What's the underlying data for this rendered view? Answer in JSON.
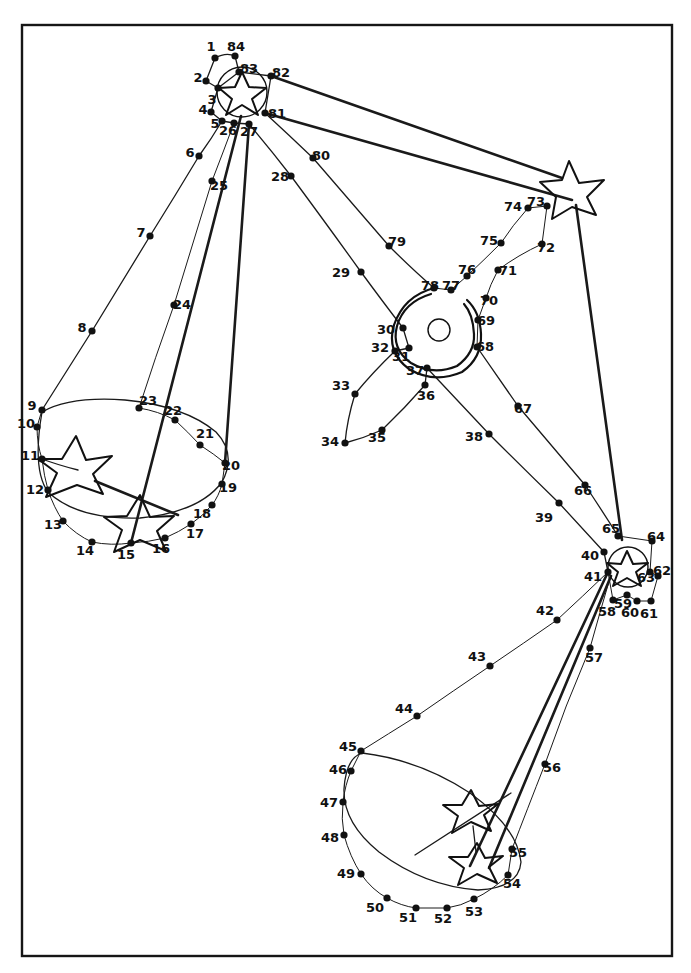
{
  "page": {
    "width": 691,
    "height": 973,
    "background_color": "#ffffff",
    "ink_color": "#111111",
    "frame": {
      "x": 22,
      "y": 25,
      "width": 650,
      "height": 931,
      "stroke": "#161616"
    }
  },
  "puzzle": {
    "kind": "connect-the-dots",
    "dot_count": 84,
    "star_count": 4,
    "description": "Hand drawn dot-to-dot line art with four five-pointed stars, two large ellipses, and a central spiral ring",
    "dots": [
      {
        "n": "1",
        "x": 215,
        "y": 58,
        "lx": 211,
        "ly": 47
      },
      {
        "n": "2",
        "x": 206,
        "y": 81,
        "lx": 198,
        "ly": 78
      },
      {
        "n": "3",
        "x": 218,
        "y": 88,
        "lx": 212,
        "ly": 100
      },
      {
        "n": "4",
        "x": 211,
        "y": 112,
        "lx": 203,
        "ly": 110
      },
      {
        "n": "5",
        "x": 222,
        "y": 121,
        "lx": 215,
        "ly": 124
      },
      {
        "n": "6",
        "x": 199,
        "y": 156,
        "lx": 190,
        "ly": 153
      },
      {
        "n": "7",
        "x": 150,
        "y": 236,
        "lx": 141,
        "ly": 233
      },
      {
        "n": "8",
        "x": 92,
        "y": 331,
        "lx": 82,
        "ly": 328
      },
      {
        "n": "9",
        "x": 42,
        "y": 410,
        "lx": 32,
        "ly": 406
      },
      {
        "n": "10",
        "x": 37,
        "y": 427,
        "lx": 26,
        "ly": 424
      },
      {
        "n": "11",
        "x": 42,
        "y": 459,
        "lx": 30,
        "ly": 456
      },
      {
        "n": "12",
        "x": 48,
        "y": 490,
        "lx": 35,
        "ly": 490
      },
      {
        "n": "13",
        "x": 63,
        "y": 521,
        "lx": 53,
        "ly": 525
      },
      {
        "n": "14",
        "x": 92,
        "y": 542,
        "lx": 85,
        "ly": 551
      },
      {
        "n": "15",
        "x": 131,
        "y": 543,
        "lx": 126,
        "ly": 555
      },
      {
        "n": "16",
        "x": 165,
        "y": 538,
        "lx": 161,
        "ly": 549
      },
      {
        "n": "17",
        "x": 191,
        "y": 524,
        "lx": 195,
        "ly": 534
      },
      {
        "n": "18",
        "x": 212,
        "y": 505,
        "lx": 202,
        "ly": 514
      },
      {
        "n": "19",
        "x": 222,
        "y": 484,
        "lx": 228,
        "ly": 488
      },
      {
        "n": "20",
        "x": 225,
        "y": 463,
        "lx": 231,
        "ly": 466
      },
      {
        "n": "21",
        "x": 200,
        "y": 445,
        "lx": 205,
        "ly": 434
      },
      {
        "n": "22",
        "x": 175,
        "y": 420,
        "lx": 173,
        "ly": 411
      },
      {
        "n": "23",
        "x": 139,
        "y": 408,
        "lx": 148,
        "ly": 401
      },
      {
        "n": "24",
        "x": 174,
        "y": 305,
        "lx": 182,
        "ly": 305
      },
      {
        "n": "25",
        "x": 212,
        "y": 181,
        "lx": 219,
        "ly": 186
      },
      {
        "n": "26",
        "x": 234,
        "y": 123,
        "lx": 228,
        "ly": 131
      },
      {
        "n": "27",
        "x": 249,
        "y": 124,
        "lx": 249,
        "ly": 132
      },
      {
        "n": "28",
        "x": 291,
        "y": 176,
        "lx": 280,
        "ly": 177
      },
      {
        "n": "29",
        "x": 361,
        "y": 272,
        "lx": 341,
        "ly": 273
      },
      {
        "n": "30",
        "x": 403,
        "y": 328,
        "lx": 386,
        "ly": 330
      },
      {
        "n": "31",
        "x": 409,
        "y": 348,
        "lx": 401,
        "ly": 357
      },
      {
        "n": "32",
        "x": 395,
        "y": 351,
        "lx": 380,
        "ly": 348
      },
      {
        "n": "33",
        "x": 355,
        "y": 394,
        "lx": 341,
        "ly": 386
      },
      {
        "n": "34",
        "x": 345,
        "y": 443,
        "lx": 330,
        "ly": 442
      },
      {
        "n": "35",
        "x": 382,
        "y": 430,
        "lx": 377,
        "ly": 438
      },
      {
        "n": "36",
        "x": 425,
        "y": 385,
        "lx": 426,
        "ly": 396
      },
      {
        "n": "37",
        "x": 427,
        "y": 368,
        "lx": 415,
        "ly": 371
      },
      {
        "n": "38",
        "x": 489,
        "y": 434,
        "lx": 474,
        "ly": 437
      },
      {
        "n": "39",
        "x": 559,
        "y": 503,
        "lx": 544,
        "ly": 518
      },
      {
        "n": "40",
        "x": 604,
        "y": 552,
        "lx": 590,
        "ly": 556
      },
      {
        "n": "41",
        "x": 608,
        "y": 572,
        "lx": 593,
        "ly": 577
      },
      {
        "n": "42",
        "x": 557,
        "y": 620,
        "lx": 545,
        "ly": 611
      },
      {
        "n": "43",
        "x": 490,
        "y": 666,
        "lx": 477,
        "ly": 657
      },
      {
        "n": "44",
        "x": 417,
        "y": 716,
        "lx": 404,
        "ly": 709
      },
      {
        "n": "45",
        "x": 361,
        "y": 751,
        "lx": 348,
        "ly": 747
      },
      {
        "n": "46",
        "x": 351,
        "y": 771,
        "lx": 338,
        "ly": 770
      },
      {
        "n": "47",
        "x": 343,
        "y": 802,
        "lx": 329,
        "ly": 803
      },
      {
        "n": "48",
        "x": 344,
        "y": 835,
        "lx": 330,
        "ly": 838
      },
      {
        "n": "49",
        "x": 361,
        "y": 874,
        "lx": 346,
        "ly": 874
      },
      {
        "n": "50",
        "x": 387,
        "y": 898,
        "lx": 375,
        "ly": 908
      },
      {
        "n": "51",
        "x": 416,
        "y": 908,
        "lx": 408,
        "ly": 918
      },
      {
        "n": "52",
        "x": 447,
        "y": 908,
        "lx": 443,
        "ly": 919
      },
      {
        "n": "53",
        "x": 474,
        "y": 899,
        "lx": 474,
        "ly": 912
      },
      {
        "n": "54",
        "x": 508,
        "y": 875,
        "lx": 512,
        "ly": 884
      },
      {
        "n": "55",
        "x": 512,
        "y": 849,
        "lx": 518,
        "ly": 853
      },
      {
        "n": "56",
        "x": 545,
        "y": 764,
        "lx": 552,
        "ly": 768
      },
      {
        "n": "57",
        "x": 590,
        "y": 648,
        "lx": 594,
        "ly": 658
      },
      {
        "n": "58",
        "x": 613,
        "y": 600,
        "lx": 607,
        "ly": 612
      },
      {
        "n": "59",
        "x": 627,
        "y": 595,
        "lx": 623,
        "ly": 604
      },
      {
        "n": "60",
        "x": 637,
        "y": 601,
        "lx": 630,
        "ly": 613
      },
      {
        "n": "61",
        "x": 651,
        "y": 601,
        "lx": 649,
        "ly": 614
      },
      {
        "n": "62",
        "x": 658,
        "y": 576,
        "lx": 662,
        "ly": 571
      },
      {
        "n": "63",
        "x": 650,
        "y": 572,
        "lx": 646,
        "ly": 578
      },
      {
        "n": "64",
        "x": 652,
        "y": 541,
        "lx": 656,
        "ly": 537
      },
      {
        "n": "65",
        "x": 618,
        "y": 536,
        "lx": 611,
        "ly": 529
      },
      {
        "n": "66",
        "x": 585,
        "y": 485,
        "lx": 583,
        "ly": 491
      },
      {
        "n": "67",
        "x": 518,
        "y": 406,
        "lx": 523,
        "ly": 409
      },
      {
        "n": "68",
        "x": 477,
        "y": 347,
        "lx": 485,
        "ly": 347
      },
      {
        "n": "69",
        "x": 478,
        "y": 320,
        "lx": 486,
        "ly": 321
      },
      {
        "n": "70",
        "x": 486,
        "y": 298,
        "lx": 489,
        "ly": 301
      },
      {
        "n": "71",
        "x": 498,
        "y": 270,
        "lx": 508,
        "ly": 271
      },
      {
        "n": "72",
        "x": 542,
        "y": 244,
        "lx": 546,
        "ly": 248
      },
      {
        "n": "73",
        "x": 547,
        "y": 206,
        "lx": 536,
        "ly": 202
      },
      {
        "n": "74",
        "x": 528,
        "y": 208,
        "lx": 513,
        "ly": 207
      },
      {
        "n": "75",
        "x": 501,
        "y": 243,
        "lx": 489,
        "ly": 241
      },
      {
        "n": "76",
        "x": 467,
        "y": 276,
        "lx": 467,
        "ly": 270
      },
      {
        "n": "77",
        "x": 451,
        "y": 290,
        "lx": 451,
        "ly": 286
      },
      {
        "n": "78",
        "x": 434,
        "y": 288,
        "lx": 430,
        "ly": 286
      },
      {
        "n": "79",
        "x": 389,
        "y": 246,
        "lx": 397,
        "ly": 242
      },
      {
        "n": "80",
        "x": 313,
        "y": 158,
        "lx": 321,
        "ly": 156
      },
      {
        "n": "81",
        "x": 265,
        "y": 113,
        "lx": 277,
        "ly": 114
      },
      {
        "n": "82",
        "x": 271,
        "y": 76,
        "lx": 281,
        "ly": 73
      },
      {
        "n": "83",
        "x": 239,
        "y": 72,
        "lx": 249,
        "ly": 69
      },
      {
        "n": "84",
        "x": 235,
        "y": 56,
        "lx": 236,
        "ly": 47
      }
    ],
    "stars": [
      {
        "name": "star-top",
        "cx": 242,
        "cy": 92,
        "r": 24,
        "rot": -8
      },
      {
        "name": "star-upper-right",
        "cx": 572,
        "cy": 188,
        "r": 28,
        "rot": 12
      },
      {
        "name": "star-left-upper",
        "cx": 73,
        "cy": 464,
        "r": 28,
        "rot": 18
      },
      {
        "name": "star-left-lower",
        "cx": 140,
        "cy": 521,
        "r": 26,
        "rot": -6
      },
      {
        "name": "star-mid-right",
        "cx": 628,
        "cy": 567,
        "r": 20,
        "rot": 10
      },
      {
        "name": "star-bottom-upper",
        "cx": 471,
        "cy": 812,
        "r": 23,
        "rot": -12
      },
      {
        "name": "star-bottom-lower",
        "cx": 476,
        "cy": 864,
        "r": 23,
        "rot": 8
      }
    ],
    "ellipses": [
      {
        "name": "ellipse-left",
        "cx": 133,
        "cy": 470,
        "rx": 102,
        "ry": 62,
        "rot": -6
      },
      {
        "name": "ellipse-bottom",
        "cx": 432,
        "cy": 823,
        "rx": 96,
        "ry": 63,
        "rot": 38
      }
    ],
    "ring": {
      "name": "central-ring",
      "cx": 440,
      "cy": 330,
      "outer_rx": 44,
      "outer_ry": 44,
      "inner_circle_r": 11
    }
  }
}
